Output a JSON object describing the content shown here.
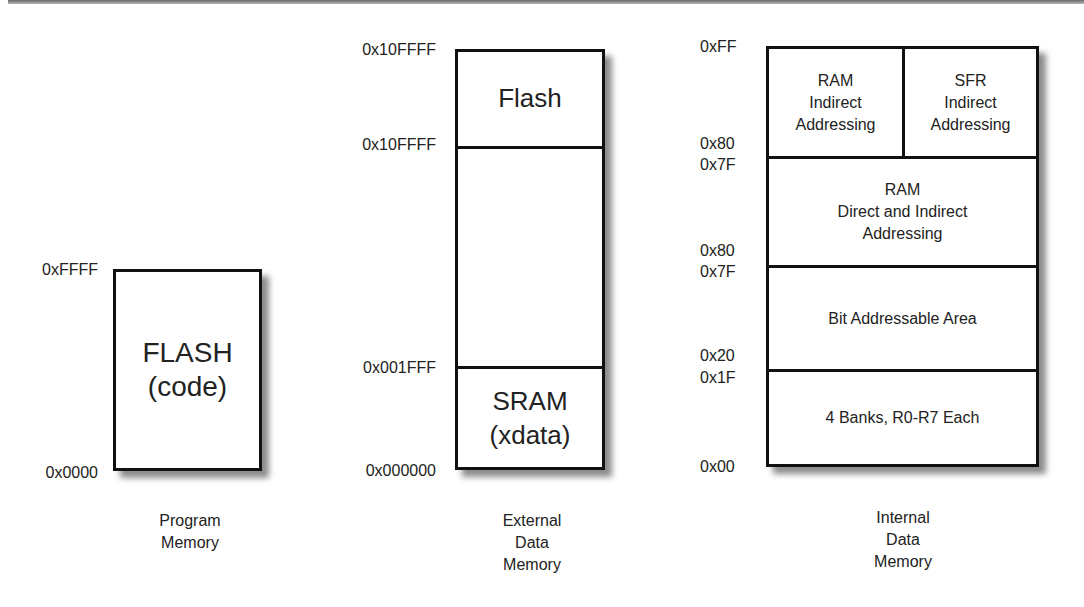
{
  "program_memory": {
    "block": {
      "line1": "FLASH",
      "line2": "(code)"
    },
    "addresses": {
      "top": "0xFFFF",
      "bottom": "0x0000"
    },
    "caption": [
      "Program",
      "Memory"
    ]
  },
  "external_data_memory": {
    "regions": [
      {
        "label": "Flash"
      },
      {
        "label": ""
      },
      {
        "line1": "SRAM",
        "line2": "(xdata)"
      }
    ],
    "addresses": {
      "a0": "0x10FFFF",
      "a1": "0x10FFFF",
      "a2": "0x001FFF",
      "a3": "0x000000"
    },
    "caption": [
      "External",
      "Data",
      "Memory"
    ]
  },
  "internal_data_memory": {
    "regions": {
      "ram_indirect": [
        "RAM",
        "Indirect",
        "Addressing"
      ],
      "sfr_indirect": [
        "SFR",
        "Indirect",
        "Addressing"
      ],
      "ram_direct_indirect": [
        "RAM",
        "Direct and Indirect",
        "Addressing"
      ],
      "bit_addressable": "Bit Addressable Area",
      "register_banks": "4 Banks, R0-R7 Each"
    },
    "addresses": {
      "a0": "0xFF",
      "a1": "0x80",
      "a2": "0x7F",
      "a3": "0x80",
      "a4": "0x7F",
      "a5": "0x20",
      "a6": "0x1F",
      "a7": "0x00"
    },
    "caption": [
      "Internal",
      "Data",
      "Memory"
    ]
  }
}
